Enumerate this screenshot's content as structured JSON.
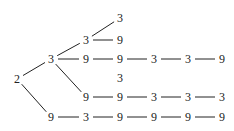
{
  "diagram": {
    "type": "tree",
    "colors": {
      "ink": "#222222",
      "background": "#ffffff"
    },
    "nodes": [
      {
        "id": "root",
        "label": "2",
        "x": 17,
        "y": 79
      },
      {
        "id": "a",
        "label": "3",
        "x": 51,
        "y": 59
      },
      {
        "id": "a1",
        "label": "3",
        "x": 86,
        "y": 40
      },
      {
        "id": "a1a",
        "label": "3",
        "x": 120,
        "y": 18
      },
      {
        "id": "a1b",
        "label": "9",
        "x": 120,
        "y": 40
      },
      {
        "id": "a2",
        "label": "9",
        "x": 86,
        "y": 59
      },
      {
        "id": "a2a",
        "label": "9",
        "x": 120,
        "y": 59
      },
      {
        "id": "a2b",
        "label": "3",
        "x": 154,
        "y": 59
      },
      {
        "id": "a2c",
        "label": "3",
        "x": 188,
        "y": 59
      },
      {
        "id": "a2d",
        "label": "9",
        "x": 222,
        "y": 59
      },
      {
        "id": "s",
        "label": "3",
        "x": 120,
        "y": 78
      },
      {
        "id": "a3",
        "label": "9",
        "x": 86,
        "y": 97
      },
      {
        "id": "a3a",
        "label": "9",
        "x": 120,
        "y": 97
      },
      {
        "id": "a3b",
        "label": "3",
        "x": 154,
        "y": 97
      },
      {
        "id": "a3c",
        "label": "3",
        "x": 188,
        "y": 97
      },
      {
        "id": "a3d",
        "label": "3",
        "x": 222,
        "y": 97
      },
      {
        "id": "b",
        "label": "9",
        "x": 51,
        "y": 117
      },
      {
        "id": "b1",
        "label": "3",
        "x": 86,
        "y": 117
      },
      {
        "id": "b2",
        "label": "9",
        "x": 120,
        "y": 117
      },
      {
        "id": "b3",
        "label": "9",
        "x": 154,
        "y": 117
      },
      {
        "id": "b4",
        "label": "9",
        "x": 188,
        "y": 117
      },
      {
        "id": "b5",
        "label": "9",
        "x": 222,
        "y": 117
      }
    ],
    "edges": [
      [
        "root",
        "a"
      ],
      [
        "root",
        "b"
      ],
      [
        "a",
        "a1"
      ],
      [
        "a",
        "a2"
      ],
      [
        "a",
        "a3"
      ],
      [
        "a1",
        "a1a"
      ],
      [
        "a1",
        "a1b"
      ],
      [
        "a2",
        "a2a"
      ],
      [
        "a2a",
        "a2b"
      ],
      [
        "a2b",
        "a2c"
      ],
      [
        "a2c",
        "a2d"
      ],
      [
        "a3",
        "a3a"
      ],
      [
        "a3a",
        "a3b"
      ],
      [
        "a3b",
        "a3c"
      ],
      [
        "a3c",
        "a3d"
      ],
      [
        "b",
        "b1"
      ],
      [
        "b1",
        "b2"
      ],
      [
        "b2",
        "b3"
      ],
      [
        "b3",
        "b4"
      ],
      [
        "b4",
        "b5"
      ]
    ]
  }
}
